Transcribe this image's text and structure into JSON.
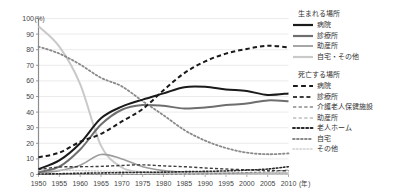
{
  "chart_data": {
    "type": "line",
    "title": "",
    "xlabel": "年",
    "ylabel": "(%)",
    "xlim": [
      1950,
      2010
    ],
    "ylim": [
      0,
      100
    ],
    "grid": true,
    "legend_position": "right",
    "x": [
      1950,
      1955,
      1960,
      1965,
      1970,
      1975,
      1980,
      1985,
      1990,
      1995,
      2000,
      2005,
      2010
    ],
    "x_ticks": [
      "1950",
      "1955",
      "1960",
      "1965",
      "1970",
      "1975",
      "1980",
      "1985",
      "1990",
      "1995",
      "2000",
      "2005",
      "2010"
    ],
    "y_ticks": [
      "0",
      "10",
      "20",
      "30",
      "40",
      "50",
      "60",
      "70",
      "80",
      "90",
      "100"
    ],
    "series": [
      {
        "name": "生まれる場所 / 病院",
        "group": "生まれる場所",
        "label": "病院",
        "style": "solid",
        "color": "#1a1a1a",
        "width": 2.0,
        "values": [
          3.5,
          9.0,
          20.0,
          36.0,
          43.5,
          48.0,
          52.0,
          56.0,
          56.2,
          54.5,
          53.5,
          51.0,
          52.0
        ]
      },
      {
        "name": "生まれる場所 / 診療所",
        "group": "生まれる場所",
        "label": "診療所",
        "style": "solid",
        "color": "#6e6e6e",
        "width": 2.0,
        "values": [
          1.5,
          5.0,
          16.0,
          32.0,
          41.5,
          44.5,
          44.0,
          42.3,
          43.0,
          44.5,
          45.5,
          47.5,
          47.0
        ]
      },
      {
        "name": "生まれる場所 / 助産所",
        "group": "生まれる場所",
        "label": "助産所",
        "style": "solid",
        "color": "#9c9c9c",
        "width": 1.6,
        "values": [
          1.0,
          2.5,
          6.0,
          12.8,
          10.0,
          5.0,
          2.5,
          1.5,
          1.2,
          1.0,
          1.0,
          1.0,
          1.0
        ]
      },
      {
        "name": "生まれる場所 / 自宅・その他",
        "group": "生まれる場所",
        "label": "自宅・その他",
        "style": "solid",
        "color": "#c9c9c9",
        "width": 2.0,
        "values": [
          95.0,
          82.0,
          58.0,
          18.5,
          4.5,
          1.5,
          0.8,
          0.5,
          0.4,
          0.3,
          0.3,
          0.3,
          0.3
        ]
      },
      {
        "name": "死亡する場所 / 病院",
        "group": "死亡する場所",
        "label": "病院",
        "style": "dashed",
        "color": "#1a1a1a",
        "width": 2.0,
        "values": [
          11.0,
          14.0,
          21.0,
          26.0,
          34.0,
          42.0,
          54.0,
          65.0,
          72.5,
          77.5,
          80.5,
          82.5,
          81.5
        ]
      },
      {
        "name": "死亡する場所 / 診療所",
        "group": "死亡する場所",
        "label": "診療所",
        "style": "dashed",
        "color": "#3d3d3d",
        "width": 1.4,
        "values": [
          3.2,
          4.8,
          5.0,
          5.2,
          5.8,
          6.2,
          5.5,
          5.0,
          4.2,
          3.5,
          3.0,
          2.6,
          2.4
        ]
      },
      {
        "name": "死亡する場所 / 介護老人保健施設",
        "group": "死亡する場所",
        "label": "介護老人保健施設",
        "style": "dashed",
        "color": "#8a8a8a",
        "width": 1.2,
        "values": [
          0.0,
          0.0,
          0.0,
          0.0,
          0.0,
          0.0,
          0.0,
          0.2,
          0.4,
          0.7,
          1.2,
          1.8,
          2.8
        ]
      },
      {
        "name": "死亡する場所 / 助産所",
        "group": "死亡する場所",
        "label": "助産所",
        "style": "dashed",
        "color": "#bdbdbd",
        "width": 1.2,
        "values": [
          0.2,
          0.2,
          0.2,
          0.2,
          0.2,
          0.2,
          0.2,
          0.2,
          0.2,
          0.2,
          0.2,
          0.2,
          0.2
        ]
      },
      {
        "name": "死亡する場所 / 老人ホーム",
        "group": "死亡する場所",
        "label": "老人ホーム",
        "style": "dotted",
        "color": "#2a2a2a",
        "width": 1.6,
        "values": [
          0.3,
          0.5,
          0.8,
          1.0,
          1.2,
          1.4,
          1.5,
          1.8,
          2.0,
          2.3,
          2.8,
          3.5,
          5.0
        ]
      },
      {
        "name": "死亡する場所 / 自宅",
        "group": "死亡する場所",
        "label": "自宅",
        "style": "dotted",
        "color": "#8a8a8a",
        "width": 1.8,
        "values": [
          82.0,
          77.5,
          70.5,
          62.0,
          56.5,
          47.0,
          38.0,
          28.5,
          21.7,
          17.0,
          14.0,
          13.0,
          13.5
        ]
      },
      {
        "name": "死亡する場所 / その他",
        "group": "死亡する場所",
        "label": "その他",
        "style": "dotted",
        "color": "#cfcfcf",
        "width": 1.4,
        "values": [
          3.0,
          2.8,
          2.5,
          2.2,
          2.0,
          1.8,
          1.6,
          1.5,
          1.4,
          1.3,
          1.2,
          1.1,
          1.0
        ]
      }
    ]
  },
  "axes": {
    "y_unit": "(%)",
    "x_unit": "(年)"
  },
  "legend": {
    "groups": [
      {
        "title": "生まれる場所",
        "items": [
          {
            "label": "病院",
            "style": "solid",
            "color": "#1a1a1a",
            "width": 2.2
          },
          {
            "label": "診療所",
            "style": "solid",
            "color": "#6e6e6e",
            "width": 2.2
          },
          {
            "label": "助産所",
            "style": "solid",
            "color": "#9c9c9c",
            "width": 1.8
          },
          {
            "label": "自宅・その他",
            "style": "solid",
            "color": "#c9c9c9",
            "width": 2.2
          }
        ]
      },
      {
        "title": "死亡する場所",
        "items": [
          {
            "label": "病院",
            "style": "dashed",
            "color": "#1a1a1a",
            "width": 2.2
          },
          {
            "label": "診療所",
            "style": "dashed",
            "color": "#3d3d3d",
            "width": 1.8
          },
          {
            "label": "介護老人保健施設",
            "style": "dashed",
            "color": "#8a8a8a",
            "width": 1.5
          },
          {
            "label": "助産所",
            "style": "dashed",
            "color": "#bdbdbd",
            "width": 1.5
          },
          {
            "label": "老人ホーム",
            "style": "dotted",
            "color": "#2a2a2a",
            "width": 2.0
          },
          {
            "label": "自宅",
            "style": "dotted",
            "color": "#8a8a8a",
            "width": 1.8
          },
          {
            "label": "その他",
            "style": "dotted",
            "color": "#cfcfcf",
            "width": 1.6
          }
        ]
      }
    ]
  }
}
